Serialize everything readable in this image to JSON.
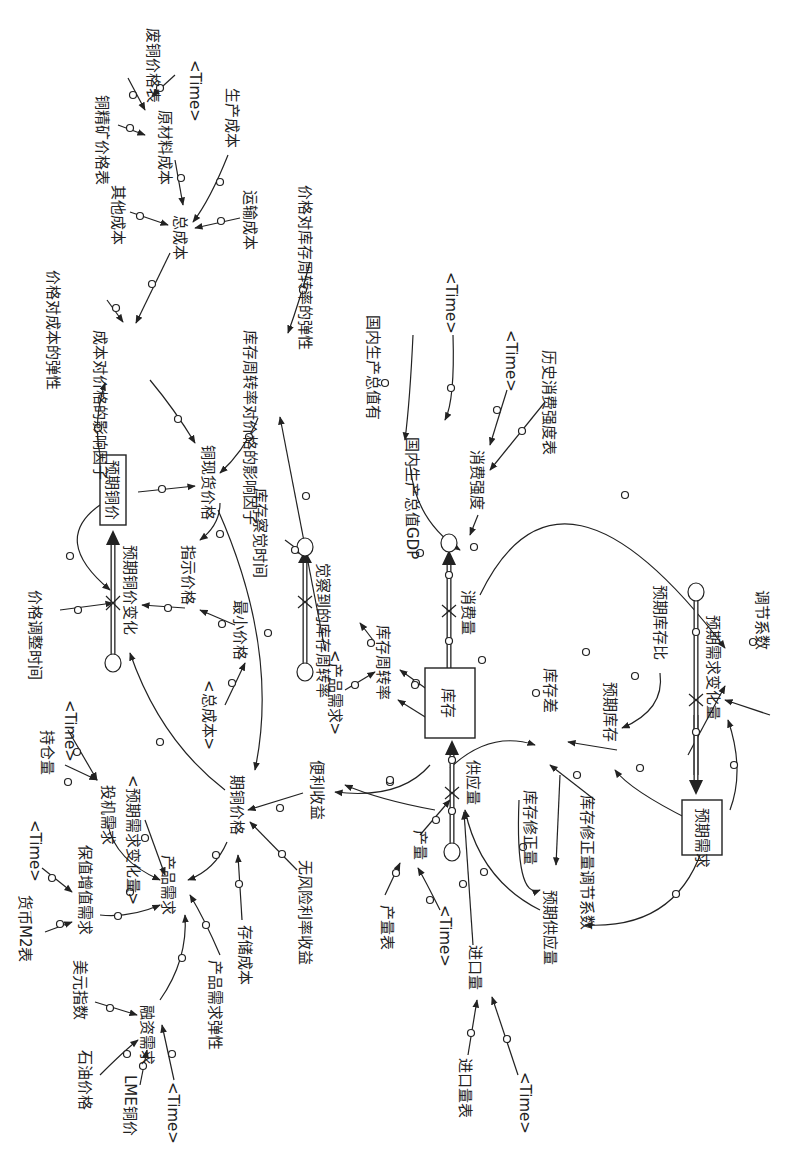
{
  "diagram": {
    "orientation": "rotated-90-clockwise",
    "stocks": [
      {
        "id": "expected_price",
        "label": "预期铜价"
      },
      {
        "id": "inventory",
        "label": "库存"
      },
      {
        "id": "expected_demand",
        "label": "预期需求"
      }
    ],
    "flows": [
      {
        "id": "expected_price_change",
        "label": "预期铜价变化"
      },
      {
        "id": "perceived_turnover",
        "label": "觉察到的库存周转率"
      },
      {
        "id": "consumption",
        "label": "消费量"
      },
      {
        "id": "supply",
        "label": "供应量"
      },
      {
        "id": "expected_demand_change",
        "label": "预期需求变化量"
      }
    ],
    "variables": {
      "scrap_price_table": "废铜价格表",
      "time_1": "<Time>",
      "concentrate_price_table": "铜精矿价格表",
      "raw_material_cost": "原材料成本",
      "production_cost": "生产成本",
      "other_cost": "其他成本",
      "total_cost": "总成本",
      "transport_cost": "运输成本",
      "price_cost_elasticity": "价格对成本的弹性",
      "cost_price_factor": "成本对价格的影响因子",
      "price_turnover_elasticity": "价格对库存周转率的弹性",
      "turnover_price_factor": "库存周转率对价格的影响因子",
      "spot_price": "铜现货价格",
      "gdp_value": "国内生产总值有",
      "time_2": "<Time>",
      "gdp": "国内生产总值GDP",
      "time_3": "<Time>",
      "hist_intensity_table": "历史消费强度表",
      "consumption_intensity": "消费强度",
      "price_adjust_time": "价格调整时间",
      "indicated_price": "指示价格",
      "min_price": "最小价格",
      "total_cost_shadow": "<总成本>",
      "inventory_perceive_time": "库存察觉时间",
      "product_demand_shadow": "<产品需求>",
      "inventory_turnover": "库存周转率",
      "inventory_gap": "库存差",
      "expected_inventory_ratio": "预期库存比",
      "expected_inventory": "预期库存",
      "adjust_coef": "调节系数",
      "position": "持仓量",
      "time_4": "<Time>",
      "speculative_demand": "投机需求",
      "expected_demand_change_shadow": "<预期需求变化量>",
      "futures_price": "期铜价格",
      "convenience_yield": "便利收益",
      "m2_table": "货币M2表",
      "time_5": "<Time>",
      "hedge_demand": "保值增值需求",
      "product_demand": "产品需求",
      "risk_free_rate": "无风险利率收益",
      "storage_cost": "存储成本",
      "demand_elasticity": "产品需求弹性",
      "usd_index": "美元指数",
      "financing_demand": "融资需求",
      "oil_price": "石油价格",
      "lme_price": "LME铜价",
      "time_6": "<Time>",
      "inventory_correction": "库存修正量",
      "inventory_correction_coef": "库存修正量调节系数",
      "expected_supply": "预期供应量",
      "output_table": "产量表",
      "output": "产量",
      "time_7": "<Time>",
      "import_volume": "进口量",
      "import_table": "进口量表",
      "time_8": "<Time>"
    }
  }
}
